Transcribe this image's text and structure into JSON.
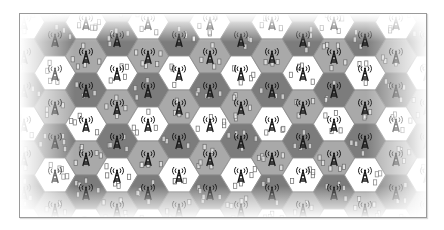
{
  "diagram": {
    "type": "hexagonal-cellular-network",
    "frame": {
      "x": 19,
      "y": 13,
      "width": 408,
      "height": 205,
      "border_color": "#9a9a9a"
    },
    "grid": {
      "columns": 12,
      "rows": 5,
      "origin_x": 54,
      "col_spacing": 31,
      "even_col_y0": 38,
      "odd_col_y0": 55,
      "row_spacing": 34,
      "hex_radius": 20.5
    },
    "reuse_colors": {
      "white": "#ffffff",
      "medium": "#a9a9a9",
      "dark": "#7c7c7c"
    },
    "even_col_pattern": [
      "dark",
      "white",
      "medium"
    ],
    "odd_col_pattern": [
      "medium",
      "dark",
      "white"
    ],
    "cell_border_color": "#8a8a8a",
    "icons": {
      "antenna": "cell-tower-icon",
      "device": "mobile-phone-icon"
    },
    "antenna_color": "#1a1a1a",
    "device_color": "#6a6a6a",
    "edge_fade": true
  }
}
